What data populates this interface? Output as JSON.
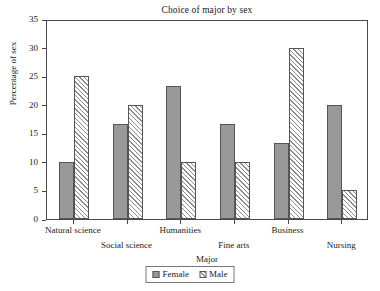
{
  "chart_data": {
    "type": "bar",
    "title": "Choice of major by sex",
    "xlabel": "Major",
    "ylabel": "Percentage of sex",
    "categories": [
      "Natural science",
      "Social science",
      "Humanities",
      "Fine arts",
      "Business",
      "Nursing"
    ],
    "series": [
      {
        "name": "Female",
        "values": [
          10,
          16.7,
          23.3,
          16.7,
          13.3,
          20
        ],
        "color": "#999999",
        "fill": "solid"
      },
      {
        "name": "Male",
        "values": [
          25,
          20,
          10,
          10,
          30,
          5
        ],
        "color": "#8c8c8c",
        "fill": "hatched"
      }
    ],
    "ylim": [
      0,
      35
    ],
    "yticks": [
      0,
      5,
      10,
      15,
      20,
      25,
      30,
      35
    ],
    "ytick_labels": [
      "0",
      "5",
      "10",
      "15",
      "20",
      "25",
      "30",
      "35"
    ],
    "grid": false,
    "legend_position": "bottom-center",
    "legend_entries": [
      "Female",
      "Male"
    ],
    "xtick_label_stagger": [
      0,
      1,
      0,
      1,
      0,
      1
    ]
  }
}
